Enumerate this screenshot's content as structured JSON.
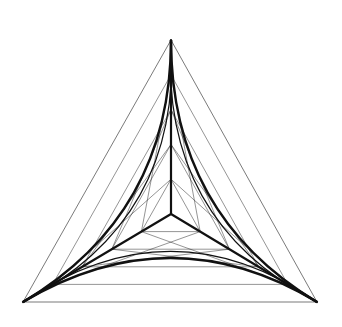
{
  "figure": {
    "width": 342,
    "height": 327,
    "background": "#ffffff",
    "stroke_color": "#111111",
    "vertices": {
      "top": [
        171,
        40
      ],
      "bottom_left": [
        23,
        302
      ],
      "bottom_right": [
        317,
        302
      ]
    },
    "center": [
      171,
      214
    ],
    "spoke_divisions": 5,
    "outer_triangle_width": 0.7,
    "spoke_width": 2.2,
    "curve_width": 2.4,
    "mesh_width": 0.6
  }
}
